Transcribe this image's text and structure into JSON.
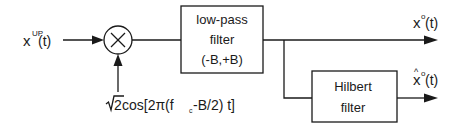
{
  "diagram": {
    "type": "block-diagram",
    "input": {
      "base": "x",
      "superscript": "UP",
      "argument": "(t)"
    },
    "mixer": {
      "symbol": "×",
      "icon": "multiplier-icon"
    },
    "carrier": {
      "sqrt_symbol": "√",
      "sqrt_arg": "2",
      "text_pre": " cos[2π(f",
      "subscript": "c",
      "text_post": "-B/2) t]"
    },
    "lowpass": {
      "line1": "low-pass",
      "line2": "filter",
      "line3": "(-B,+B)"
    },
    "hilbert": {
      "line1": "Hilbert",
      "line2": "filter"
    },
    "output_main": {
      "base": "x",
      "superscript": "o",
      "argument": "(t)"
    },
    "output_hilbert": {
      "hat": "^",
      "base": "x",
      "superscript": "o",
      "argument": "(t)"
    }
  }
}
